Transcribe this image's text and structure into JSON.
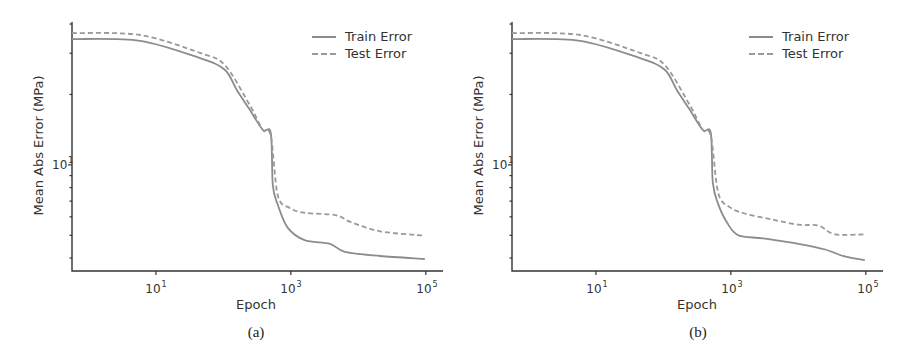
{
  "figure": {
    "panels": [
      {
        "caption": "(a)",
        "xlabel": "Epoch",
        "ylabel": "Mean Abs Error (MPa)"
      },
      {
        "caption": "(b)",
        "xlabel": "Epoch",
        "ylabel": "Mean Abs Error (MPa)"
      }
    ],
    "legend": {
      "train": "Train Error",
      "test": "Test Error"
    },
    "xticks": [
      {
        "base": "10",
        "exp": "1"
      },
      {
        "base": "10",
        "exp": "3"
      },
      {
        "base": "10",
        "exp": "5"
      }
    ],
    "yticks": [
      {
        "base": "10",
        "exp": "1"
      }
    ],
    "colors": {
      "train": "#8c8c8c",
      "test": "#9a9a9a",
      "axis": "#333333"
    }
  },
  "chart_data": [
    {
      "type": "line",
      "title": "(a)",
      "xlabel": "Epoch",
      "ylabel": "Mean Abs Error (MPa)",
      "xscale": "log",
      "yscale": "log",
      "xlim": [
        0.57,
        180000
      ],
      "ylim": [
        3.52,
        40.8
      ],
      "xticks": [
        10,
        1000,
        100000
      ],
      "xtick_labels": [
        "10^1",
        "10^3",
        "10^5"
      ],
      "yticks": [
        10
      ],
      "ytick_labels": [
        "10^1"
      ],
      "grid": false,
      "legend_position": "upper right",
      "series": [
        {
          "name": "Train Error",
          "style": "solid",
          "x": [
            0.57,
            5.8,
            45,
            105,
            158,
            246,
            385,
            505,
            540,
            640,
            900,
            1600,
            3800,
            6300,
            21000,
            96600
          ],
          "y": [
            34.5,
            33.9,
            28.6,
            25.5,
            20.9,
            17.2,
            14.1,
            13.7,
            8.2,
            6.75,
            5.38,
            4.77,
            4.6,
            4.25,
            4.08,
            3.96
          ]
        },
        {
          "name": "Test Error",
          "style": "dashed",
          "x": [
            0.57,
            5.8,
            45,
            105,
            246,
            385,
            505,
            640,
            960,
            1600,
            4600,
            7700,
            21000,
            96600
          ],
          "y": [
            36.6,
            35.9,
            30.1,
            26.7,
            18.0,
            14.1,
            13.3,
            7.4,
            6.55,
            6.24,
            6.1,
            5.7,
            5.2,
            4.98
          ]
        }
      ]
    },
    {
      "type": "line",
      "title": "(b)",
      "xlabel": "Epoch",
      "ylabel": "Mean Abs Error (MPa)",
      "xscale": "log",
      "yscale": "log",
      "xlim": [
        0.57,
        180000
      ],
      "ylim": [
        3.52,
        40.8
      ],
      "xticks": [
        10,
        1000,
        100000
      ],
      "xtick_labels": [
        "10^1",
        "10^3",
        "10^5"
      ],
      "yticks": [
        10
      ],
      "ytick_labels": [
        "10^1"
      ],
      "grid": false,
      "legend_position": "upper right",
      "series": [
        {
          "name": "Train Error",
          "style": "solid",
          "x": [
            0.57,
            5.8,
            45,
            105,
            158,
            246,
            385,
            505,
            540,
            650,
            900,
            1300,
            3000,
            10000,
            25000,
            50000,
            96600
          ],
          "y": [
            34.5,
            33.9,
            28.6,
            25.5,
            20.9,
            17.2,
            14.1,
            13.7,
            8.4,
            6.8,
            5.6,
            5.0,
            4.85,
            4.6,
            4.35,
            4.05,
            3.92
          ]
        },
        {
          "name": "Test Error",
          "style": "dashed",
          "x": [
            0.57,
            5.8,
            45,
            105,
            246,
            385,
            505,
            650,
            960,
            1600,
            4000,
            10000,
            20000,
            35000,
            96600
          ],
          "y": [
            36.6,
            35.9,
            30.1,
            26.7,
            18.0,
            14.1,
            13.3,
            7.6,
            6.6,
            6.2,
            5.85,
            5.55,
            5.5,
            5.05,
            5.05
          ]
        }
      ]
    }
  ]
}
